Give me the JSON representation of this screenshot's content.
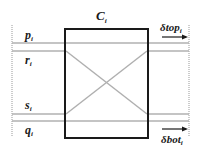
{
  "diagram": {
    "cell_label": "C",
    "cell_label_sub": "i",
    "signals": [
      {
        "name": "p",
        "sub": "i",
        "y": 43
      },
      {
        "name": "r",
        "sub": "i",
        "y": 51
      },
      {
        "name": "s",
        "sub": "i",
        "y": 114
      },
      {
        "name": "q",
        "sub": "i",
        "y": 121
      }
    ],
    "arrows": {
      "top": {
        "label": "δtop",
        "sub": "i"
      },
      "bottom": {
        "label": "δbot",
        "sub": "i"
      }
    },
    "colors": {
      "box": "#1a1a1a",
      "wire": "#b0b0b0",
      "boundary": "#999999",
      "text": "#1a1a1a"
    }
  }
}
